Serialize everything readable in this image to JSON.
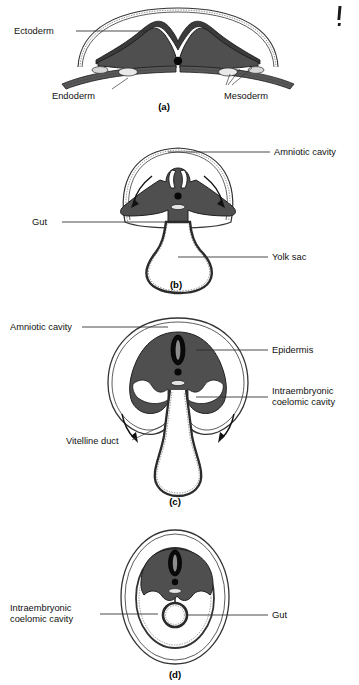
{
  "figure": {
    "title_visible": false,
    "corner_mark": "A",
    "background_color": "#ffffff",
    "ink_color": "#1f1f1f",
    "tissue_fill_color": "#4f4f4f",
    "membrane_color": "#333333"
  },
  "panels": [
    {
      "id": "a",
      "caption": "(a)",
      "labels": [
        {
          "key": "ectoderm",
          "text": "Ectoderm"
        },
        {
          "key": "endoderm",
          "text": "Endoderm"
        },
        {
          "key": "mesoderm",
          "text": "Mesoderm"
        }
      ]
    },
    {
      "id": "b",
      "caption": "(b)",
      "labels": [
        {
          "key": "amniotic-cavity",
          "text": "Amniotic cavity"
        },
        {
          "key": "gut",
          "text": "Gut"
        },
        {
          "key": "yolk-sac",
          "text": "Yolk sac"
        }
      ]
    },
    {
      "id": "c",
      "caption": "(c)",
      "labels": [
        {
          "key": "amniotic-cavity",
          "text": "Amniotic cavity"
        },
        {
          "key": "epidermis",
          "text": "Epidermis"
        },
        {
          "key": "intraembryonic-coelomic-cavity-line1",
          "text": "Intraembryonic"
        },
        {
          "key": "intraembryonic-coelomic-cavity-line2",
          "text": "coelomic cavity"
        },
        {
          "key": "vitelline-duct",
          "text": "Vitelline duct"
        }
      ]
    },
    {
      "id": "d",
      "caption": "(d)",
      "labels": [
        {
          "key": "intraembryonic-coelomic-cavity-line1",
          "text": "Intraembryonic"
        },
        {
          "key": "intraembryonic-coelomic-cavity-line2",
          "text": "coelomic cavity"
        },
        {
          "key": "gut",
          "text": "Gut"
        }
      ]
    }
  ]
}
